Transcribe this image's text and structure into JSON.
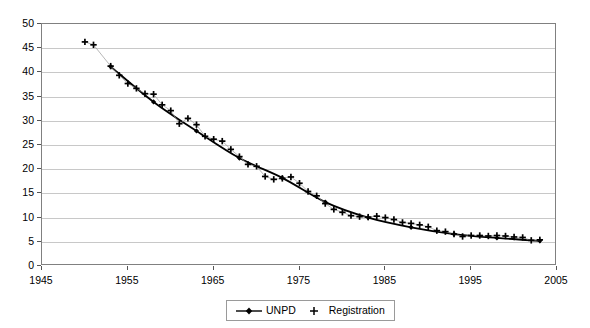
{
  "chart_data": {
    "type": "line",
    "title": "",
    "subtitle": "",
    "xlabel": "",
    "ylabel": "",
    "xlim": [
      1945,
      2005
    ],
    "ylim": [
      0,
      50
    ],
    "grid": true,
    "legend_position": "bottom-center",
    "y_ticks": [
      0,
      5,
      10,
      15,
      20,
      25,
      30,
      35,
      40,
      45,
      50
    ],
    "x_ticks": [
      1945,
      1955,
      1965,
      1975,
      1985,
      1995,
      2005
    ],
    "series": [
      {
        "name": "UNPD",
        "marker": "diamond",
        "line": true,
        "color": "#000000",
        "x": [
          1953,
          1958,
          1963,
          1968,
          1973,
          1978,
          1983,
          1988,
          1993,
          1998,
          2003
        ],
        "values": [
          41.2,
          33.9,
          27.9,
          22.3,
          18.2,
          13.2,
          10.0,
          8.0,
          6.6,
          5.8,
          5.2
        ]
      },
      {
        "name": "Registration",
        "marker": "plus",
        "line": false,
        "color": "#000000",
        "x": [
          1950,
          1951,
          1953,
          1954,
          1955,
          1956,
          1957,
          1958,
          1959,
          1960,
          1961,
          1962,
          1963,
          1964,
          1965,
          1966,
          1967,
          1968,
          1969,
          1970,
          1971,
          1972,
          1973,
          1974,
          1975,
          1976,
          1977,
          1978,
          1979,
          1980,
          1981,
          1982,
          1983,
          1984,
          1985,
          1986,
          1987,
          1988,
          1989,
          1990,
          1991,
          1992,
          1993,
          1994,
          1995,
          1996,
          1997,
          1998,
          1999,
          2000,
          2001,
          2002,
          2003
        ],
        "values": [
          46.3,
          45.7,
          41.3,
          39.4,
          37.7,
          36.7,
          35.6,
          35.5,
          33.3,
          32.1,
          29.4,
          30.5,
          29.2,
          26.8,
          26.2,
          25.8,
          24.1,
          22.6,
          21.0,
          20.6,
          18.5,
          17.9,
          18.1,
          18.4,
          17.1,
          15.4,
          14.5,
          12.9,
          11.7,
          11.1,
          10.4,
          10.2,
          10.1,
          10.3,
          10.0,
          9.6,
          9.0,
          8.8,
          8.5,
          8.1,
          7.3,
          7.1,
          6.6,
          6.1,
          6.3,
          6.3,
          6.2,
          6.3,
          6.2,
          6.0,
          5.9,
          5.3,
          5.4
        ]
      }
    ]
  },
  "legend": {
    "items": [
      {
        "label": "UNPD",
        "marker": "line-diamond"
      },
      {
        "label": "Registration",
        "marker": "plus"
      }
    ]
  },
  "axes": {
    "y_tick_labels": [
      "0",
      "5",
      "10",
      "15",
      "20",
      "25",
      "30",
      "35",
      "40",
      "45",
      "50"
    ],
    "x_tick_labels": [
      "1945",
      "1955",
      "1965",
      "1975",
      "1985",
      "1995",
      "2005"
    ]
  },
  "colors": {
    "series": "#000000",
    "grid": "#c8c8c8",
    "frame": "#808080",
    "background": "#ffffff",
    "text": "#000000"
  }
}
